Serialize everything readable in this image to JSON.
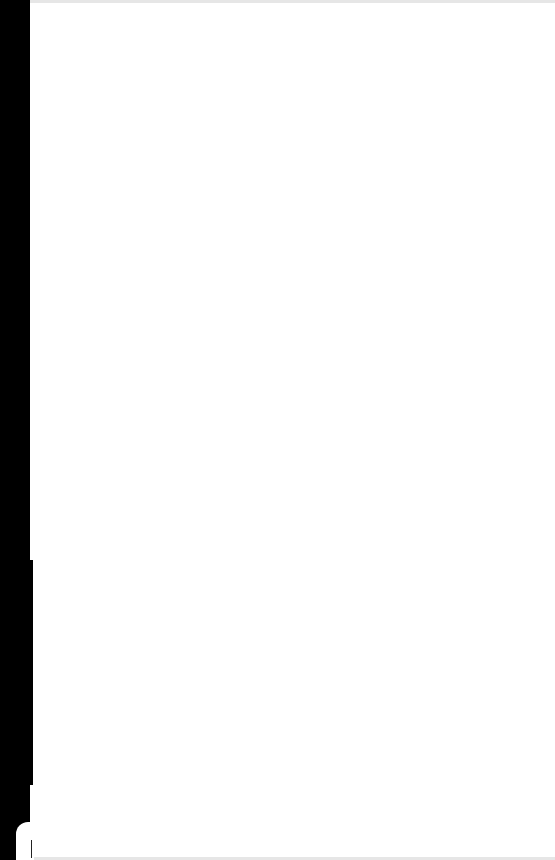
{
  "page": {
    "type": "blank-scanned-page",
    "text": "",
    "colors": {
      "background": "#ffffff",
      "scan_edge": "#000000"
    }
  }
}
